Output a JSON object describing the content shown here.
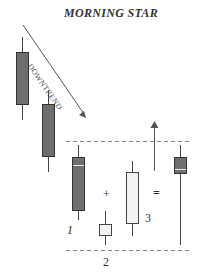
{
  "title": "MORNING STAR",
  "trend_label": "DOWNTREND",
  "labels": {
    "candle1": "1",
    "candle2": "2",
    "candle3": "3",
    "plus": "+",
    "equals": "="
  },
  "colors": {
    "bearish_body": "#6e6e6e",
    "bullish_body": "#f3f3f3",
    "outline": "#444444",
    "dashed_line": "#888888",
    "arrow": "#555555"
  },
  "candles": [
    {
      "id": "downtrend-a",
      "type": "bearish"
    },
    {
      "id": "downtrend-b",
      "type": "bearish"
    },
    {
      "id": "1",
      "type": "bearish"
    },
    {
      "id": "2",
      "type": "bullish-small"
    },
    {
      "id": "3",
      "type": "bullish"
    },
    {
      "id": "result",
      "type": "bearish-hammer"
    }
  ]
}
